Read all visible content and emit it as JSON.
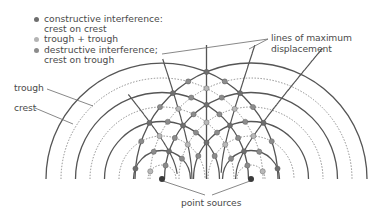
{
  "legend": {
    "items": [
      {
        "lines": [
          "constructive interference:",
          "crest on crest"
        ],
        "color": "#6e6e6e",
        "kind": "crest-crest"
      },
      {
        "lines": [
          "trough + trough"
        ],
        "color": "#b4b4b4",
        "kind": "trough-trough"
      },
      {
        "lines": [
          "destructive interference;",
          "crest on trough"
        ],
        "color": "#8c8c8c",
        "kind": "crest-trough"
      }
    ]
  },
  "labels": {
    "trough": "trough",
    "crest": "crest",
    "max_line_1": "lines of maximum",
    "max_line_2": "displacement",
    "point_sources": "point sources"
  },
  "geometry": {
    "sources": [
      [
        162,
        179
      ],
      [
        251,
        179
      ]
    ],
    "crest_radii": [
      28.5,
      57.5,
      86.5,
      116
    ],
    "trough_radii": [
      14,
      43,
      72,
      101
    ],
    "baseline_y": 179,
    "line_color": "#555555",
    "dotted_color": "#8a8a8a"
  },
  "colors": {
    "crest_crest": "#6e6e6e",
    "trough_trough": "#b8b8b8",
    "crest_trough": "#8c8c8c",
    "source": "#3a3a3a"
  }
}
